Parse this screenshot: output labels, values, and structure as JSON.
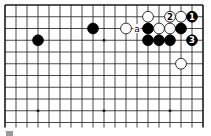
{
  "diagram": {
    "type": "go-board-fragment",
    "grid": {
      "columns": 19,
      "visible_rows": 11,
      "origin_x": 5,
      "origin_y": 5,
      "spacing_x": 11.0,
      "spacing_y": 11.75,
      "top_edge": true,
      "left_edge": true,
      "right_edge": true,
      "bottom_edge": false,
      "line_color": "#1a1a1a"
    },
    "hoshi": [
      {
        "col": 3,
        "row": 9
      },
      {
        "col": 9,
        "row": 3
      },
      {
        "col": 9,
        "row": 9
      },
      {
        "col": 15,
        "row": 9
      }
    ],
    "stones": [
      {
        "color": "black",
        "col": 3,
        "row": 3,
        "label": ""
      },
      {
        "color": "black",
        "col": 8,
        "row": 2,
        "label": ""
      },
      {
        "color": "white",
        "col": 11,
        "row": 2,
        "label": ""
      },
      {
        "color": "white",
        "col": 13,
        "row": 1,
        "label": ""
      },
      {
        "color": "white",
        "col": 15,
        "row": 1,
        "label": "2"
      },
      {
        "color": "white",
        "col": 16,
        "row": 1,
        "label": ""
      },
      {
        "color": "black",
        "col": 17,
        "row": 1,
        "label": "1"
      },
      {
        "color": "black",
        "col": 13,
        "row": 2,
        "label": ""
      },
      {
        "color": "white",
        "col": 14,
        "row": 2,
        "label": ""
      },
      {
        "color": "white",
        "col": 15,
        "row": 2,
        "label": ""
      },
      {
        "color": "black",
        "col": 16,
        "row": 2,
        "label": ""
      },
      {
        "color": "black",
        "col": 13,
        "row": 3,
        "label": ""
      },
      {
        "color": "black",
        "col": 14,
        "row": 3,
        "label": ""
      },
      {
        "color": "black",
        "col": 15,
        "row": 3,
        "label": ""
      },
      {
        "color": "black",
        "col": 17,
        "row": 3,
        "label": "3"
      },
      {
        "color": "white",
        "col": 16,
        "row": 5,
        "label": ""
      }
    ],
    "point_labels": [
      {
        "col": 12,
        "row": 2,
        "text": "a"
      }
    ],
    "colors": {
      "black_stone": "#000000",
      "white_stone": "#ffffff",
      "stone_outline": "#000000",
      "background": "#ffffff"
    }
  }
}
